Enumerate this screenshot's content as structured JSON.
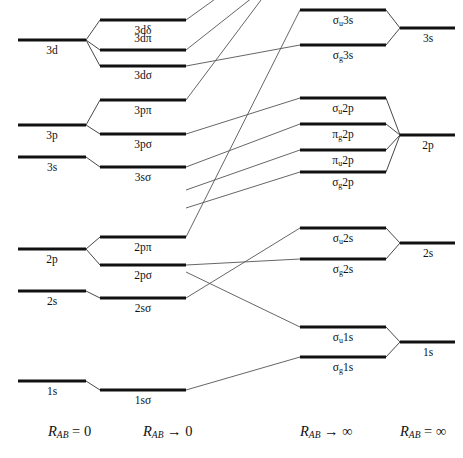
{
  "geometry": {
    "width": 463,
    "height": 458,
    "columns": {
      "united_atom": {
        "x1": 18,
        "x2": 86
      },
      "united_mo": {
        "x1": 100,
        "x2": 186
      },
      "separated_mo": {
        "x1": 300,
        "x2": 386
      },
      "separated_atom": {
        "x1": 400,
        "x2": 455
      }
    }
  },
  "style": {
    "level_color": "#111111",
    "line_color": "#555555",
    "background": "#ffffff",
    "level_thickness": 3,
    "correlation_thickness": 0.9
  },
  "axis_labels": [
    {
      "id": "axis-united-atom",
      "text": "R_AB = 0",
      "html": "<i>R</i><sub>AB</sub> = 0",
      "x": 48,
      "y": 432
    },
    {
      "id": "axis-united-mo",
      "text": "R_AB → 0",
      "html": "<i>R</i><sub>AB</sub> → 0",
      "x": 143,
      "y": 432
    },
    {
      "id": "axis-separated-mo",
      "text": "R_AB → ∞",
      "html": "<i>R</i><sub>AB</sub> → ∞",
      "x": 313,
      "y": 432
    },
    {
      "id": "axis-separated-atom",
      "text": "R_AB = ∞",
      "html": "<i>R</i><sub>AB</sub> = ∞",
      "x": 413,
      "y": 432
    }
  ],
  "levels": {
    "united_atom": [
      {
        "id": "ua-3d",
        "label": "3d",
        "html": "3d",
        "x1": 18,
        "x2": 86,
        "y": 40,
        "label_x": 52,
        "label_y": 45
      },
      {
        "id": "ua-3p",
        "label": "3p",
        "html": "3p",
        "x1": 18,
        "x2": 86,
        "y": 125,
        "label_x": 52,
        "label_y": 130
      },
      {
        "id": "ua-3s",
        "label": "3s",
        "html": "3s",
        "x1": 18,
        "x2": 86,
        "y": 157,
        "label_x": 52,
        "label_y": 162
      },
      {
        "id": "ua-2p",
        "label": "2p",
        "html": "2p",
        "x1": 18,
        "x2": 86,
        "y": 249,
        "label_x": 52,
        "label_y": 254
      },
      {
        "id": "ua-2s",
        "label": "2s",
        "html": "2s",
        "x1": 18,
        "x2": 86,
        "y": 291,
        "label_x": 52,
        "label_y": 296
      },
      {
        "id": "ua-1s",
        "label": "1s",
        "html": "1s",
        "x1": 18,
        "x2": 86,
        "y": 381,
        "label_x": 52,
        "label_y": 386
      }
    ],
    "united_mo": [
      {
        "id": "umo-3ddelta",
        "label": "3dδ",
        "html": "3dδ",
        "x1": 100,
        "x2": 186,
        "y": 20,
        "label_x": 130,
        "label_y": 25
      },
      {
        "id": "umo-3dpi",
        "label": "3dπ",
        "html": "3dπ",
        "x1": 100,
        "x2": 186,
        "y": 50,
        "label_x": 130,
        "label_y": 38
      },
      {
        "id": "umo-3dsigma",
        "label": "3dσ",
        "html": "3dσ",
        "x1": 100,
        "x2": 186,
        "y": 66,
        "label_x": 130,
        "label_y": 71
      },
      {
        "id": "umo-3ppi",
        "label": "3pπ",
        "html": "3pπ",
        "x1": 100,
        "x2": 186,
        "y": 100,
        "label_x": 130,
        "label_y": 105
      },
      {
        "id": "umo-3psigma",
        "label": "3pσ",
        "html": "3pσ",
        "x1": 100,
        "x2": 186,
        "y": 134,
        "label_x": 130,
        "label_y": 139
      },
      {
        "id": "umo-3ssigma",
        "label": "3sσ",
        "html": "3sσ",
        "x1": 100,
        "x2": 186,
        "y": 167,
        "label_x": 130,
        "label_y": 172
      },
      {
        "id": "umo-2ppi",
        "label": "2pπ",
        "html": "2pπ",
        "x1": 100,
        "x2": 186,
        "y": 237,
        "label_x": 130,
        "label_y": 242
      },
      {
        "id": "umo-2psigma",
        "label": "2pσ",
        "html": "2pσ",
        "x1": 100,
        "x2": 186,
        "y": 265,
        "label_x": 130,
        "label_y": 270
      },
      {
        "id": "umo-2ssigma",
        "label": "2sσ",
        "html": "2sσ",
        "x1": 100,
        "x2": 186,
        "y": 298,
        "label_x": 130,
        "label_y": 303
      },
      {
        "id": "umo-1ssigma",
        "label": "1sσ",
        "html": "1sσ",
        "x1": 100,
        "x2": 186,
        "y": 390,
        "label_x": 130,
        "label_y": 395
      }
    ],
    "separated_mo": [
      {
        "id": "smo-su3s",
        "label": "σu3s",
        "html": "σ<sub>u</sub>3s",
        "x1": 300,
        "x2": 386,
        "y": 10,
        "label_x": 332,
        "label_y": 15
      },
      {
        "id": "smo-sg3s",
        "label": "σg3s",
        "html": "σ<sub>g</sub>3s",
        "x1": 300,
        "x2": 386,
        "y": 45,
        "label_x": 332,
        "label_y": 50
      },
      {
        "id": "smo-su2p",
        "label": "σu2p",
        "html": "σ<sub>u</sub>2p",
        "x1": 300,
        "x2": 386,
        "y": 98,
        "label_x": 332,
        "label_y": 103
      },
      {
        "id": "smo-pg2p",
        "label": "πg2p",
        "html": "π<sub>g</sub>2p",
        "x1": 300,
        "x2": 386,
        "y": 124,
        "label_x": 332,
        "label_y": 129
      },
      {
        "id": "smo-pu2p",
        "label": "πu2p",
        "html": "π<sub>u</sub>2p",
        "x1": 300,
        "x2": 386,
        "y": 150,
        "label_x": 332,
        "label_y": 155
      },
      {
        "id": "smo-sg2p",
        "label": "σg2p",
        "html": "σ<sub>g</sub>2p",
        "x1": 300,
        "x2": 386,
        "y": 172,
        "label_x": 332,
        "label_y": 177
      },
      {
        "id": "smo-su2s",
        "label": "σu2s",
        "html": "σ<sub>u</sub>2s",
        "x1": 300,
        "x2": 386,
        "y": 228,
        "label_x": 332,
        "label_y": 233
      },
      {
        "id": "smo-sg2s",
        "label": "σg2s",
        "html": "σ<sub>g</sub>2s",
        "x1": 300,
        "x2": 386,
        "y": 259,
        "label_x": 332,
        "label_y": 264
      },
      {
        "id": "smo-su1s",
        "label": "σu1s",
        "html": "σ<sub>u</sub>1s",
        "x1": 300,
        "x2": 386,
        "y": 327,
        "label_x": 332,
        "label_y": 332
      },
      {
        "id": "smo-sg1s",
        "label": "σg1s",
        "html": "σ<sub>g</sub>1s",
        "x1": 300,
        "x2": 386,
        "y": 357,
        "label_x": 332,
        "label_y": 362
      }
    ],
    "separated_atom": [
      {
        "id": "sa-3s",
        "label": "3s",
        "html": "3s",
        "x1": 400,
        "x2": 455,
        "y": 28,
        "label_x": 427,
        "label_y": 33
      },
      {
        "id": "sa-2p",
        "label": "2p",
        "html": "2p",
        "x1": 400,
        "x2": 455,
        "y": 135,
        "label_x": 427,
        "label_y": 140
      },
      {
        "id": "sa-2s",
        "label": "2s",
        "html": "2s",
        "x1": 400,
        "x2": 455,
        "y": 243,
        "label_x": 427,
        "label_y": 248
      },
      {
        "id": "sa-1s",
        "label": "1s",
        "html": "1s",
        "x1": 400,
        "x2": 455,
        "y": 342,
        "label_x": 427,
        "label_y": 347
      }
    ]
  },
  "splittings": [
    {
      "id": "split-3d",
      "from": "ua-3d",
      "to": [
        "umo-3ddelta",
        "umo-3dpi",
        "umo-3dsigma"
      ]
    },
    {
      "id": "split-3p",
      "from": "ua-3p",
      "to": [
        "umo-3ppi",
        "umo-3psigma"
      ]
    },
    {
      "id": "split-3s",
      "from": "ua-3s",
      "to": [
        "umo-3ssigma"
      ]
    },
    {
      "id": "split-2p",
      "from": "ua-2p",
      "to": [
        "umo-2ppi",
        "umo-2psigma"
      ]
    },
    {
      "id": "split-2s",
      "from": "ua-2s",
      "to": [
        "umo-2ssigma"
      ]
    },
    {
      "id": "split-1s",
      "from": "ua-1s",
      "to": [
        "umo-1ssigma"
      ]
    },
    {
      "id": "merge-3s",
      "from": "sa-3s",
      "to": [
        "smo-su3s",
        "smo-sg3s"
      ]
    },
    {
      "id": "merge-2p",
      "from": "sa-2p",
      "to": [
        "smo-su2p",
        "smo-pg2p",
        "smo-pu2p",
        "smo-sg2p"
      ]
    },
    {
      "id": "merge-2s",
      "from": "sa-2s",
      "to": [
        "smo-su2s",
        "smo-sg2s"
      ]
    },
    {
      "id": "merge-1s",
      "from": "sa-1s",
      "to": [
        "smo-su1s",
        "smo-sg1s"
      ]
    }
  ],
  "correlations": [
    {
      "id": "corr-3ddelta",
      "left": "umo-3ddelta",
      "right_y": -30,
      "note": "3d-delta rises off top of frame"
    },
    {
      "id": "corr-3dpi",
      "left": "umo-3dpi",
      "right_y": -18,
      "note": "3d-pi rises off top of frame"
    },
    {
      "id": "corr-3dsigma",
      "left": "umo-3dsigma",
      "right": "smo-sg3s"
    },
    {
      "id": "corr-3ppi",
      "left": "umo-3ppi",
      "right_y": -40,
      "note": "3p-pi rises off top of frame"
    },
    {
      "id": "corr-3psigma",
      "left": "umo-3psigma",
      "right": "smo-su2p"
    },
    {
      "id": "corr-3ssigma",
      "left": "umo-3ssigma",
      "right": "smo-pg2p"
    },
    {
      "id": "corr-2ppi",
      "left": "umo-2ppi",
      "right": "smo-su3s"
    },
    {
      "id": "corr-2psigma",
      "left": "umo-2psigma",
      "right": "smo-sg2s"
    },
    {
      "id": "corr-2ssigma",
      "left": "umo-2ssigma",
      "right": "smo-su2s"
    },
    {
      "id": "corr-1ssigma",
      "left": "umo-1ssigma",
      "right": "smo-sg1s"
    },
    {
      "id": "corr-extra-pu2p",
      "left_y": 200,
      "right": "smo-pu2p",
      "note": "line from 2p-pi region to pi-u 2p"
    },
    {
      "id": "corr-extra-sg2p",
      "left_y": 236,
      "right": "smo-sg2p",
      "note": "line to sigma-g 2p"
    },
    {
      "id": "corr-extra-su1s",
      "left_y": 262,
      "right": "smo-su1s",
      "note": "line to sigma-u 1s"
    }
  ]
}
